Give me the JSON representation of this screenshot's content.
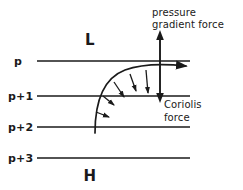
{
  "figure": {
    "kind": "meteorological-force-balance-diagram",
    "background_color": "#ffffff",
    "ink_color": "#1a1a1a"
  },
  "isobars": [
    {
      "label": "p",
      "y": 61,
      "label_x": 18,
      "label_y": 65,
      "x_start": 37,
      "x_end": 190
    },
    {
      "label": "p+1",
      "y": 96,
      "label_x": 8,
      "label_y": 100,
      "x_start": 37,
      "x_end": 190
    },
    {
      "label": "p+2",
      "y": 127,
      "label_x": 8,
      "label_y": 131,
      "x_start": 37,
      "x_end": 190
    },
    {
      "label": "p+3",
      "y": 158,
      "label_x": 8,
      "label_y": 162,
      "x_start": 37,
      "x_end": 190
    }
  ],
  "pressure_centers": [
    {
      "name": "low-pressure-center",
      "label": "L",
      "x": 90,
      "y": 45
    },
    {
      "name": "high-pressure-center",
      "label": "H",
      "x": 90,
      "y": 181
    }
  ],
  "force_labels": {
    "pressure_gradient": {
      "lines": [
        "pressure",
        "gradient  force"
      ],
      "x": 152,
      "y_first": 16,
      "line_height": 12
    },
    "coriolis": {
      "lines": [
        "Coriolis",
        "force"
      ],
      "x": 162,
      "y_first": 108,
      "line_height": 13
    }
  },
  "force_axis": {
    "name": "vertical-double-arrow",
    "x": 160,
    "y_top": 31,
    "y_bottom": 101,
    "upper_direction": "pressure gradient force (toward low)",
    "lower_direction": "Coriolis force (toward high)"
  },
  "trajectory": {
    "name": "air-parcel-trajectory",
    "start_x": 95,
    "start_y": 133,
    "end_x": 192,
    "end_y": 70,
    "description": "curved path of air parcel turning from northward to eastward"
  },
  "coriolis_ticks": [
    {
      "index": 0,
      "x1": 97,
      "y1": 113,
      "x2": 108,
      "y2": 116
    },
    {
      "index": 1,
      "x1": 104,
      "y1": 97,
      "x2": 114,
      "y2": 104
    },
    {
      "index": 2,
      "x1": 115,
      "y1": 84,
      "x2": 124,
      "y2": 96
    },
    {
      "index": 3,
      "x1": 131,
      "y1": 76,
      "x2": 136,
      "y2": 90
    },
    {
      "index": 4,
      "x1": 146,
      "y1": 72,
      "x2": 148,
      "y2": 92
    }
  ]
}
